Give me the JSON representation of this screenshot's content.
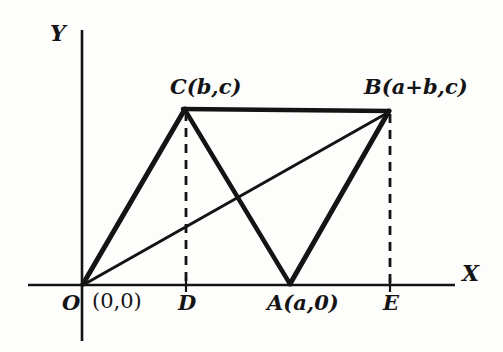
{
  "figure": {
    "kind": "coordinate-geometry-diagram",
    "background_color": "#fdfdfc",
    "ink_color": "#141414"
  },
  "axes": {
    "x_label": "X",
    "y_label": "Y",
    "x_axis": {
      "x1": 28,
      "y1": 285,
      "x2": 455,
      "y2": 285,
      "width": 2.6
    },
    "y_axis": {
      "x1": 82,
      "y1": 30,
      "x2": 82,
      "y2": 341,
      "width": 2.6
    }
  },
  "points": [
    {
      "id": "O",
      "label": "O",
      "x": 82,
      "y": 285
    },
    {
      "id": "D",
      "label": "D",
      "x": 186,
      "y": 285
    },
    {
      "id": "A",
      "label": "A(a,0)",
      "x": 290,
      "y": 285
    },
    {
      "id": "E",
      "label": "E",
      "x": 390,
      "y": 285
    },
    {
      "id": "C",
      "label": "C(b,c)",
      "x": 185,
      "y": 108
    },
    {
      "id": "B",
      "label": "B(a+b,c)",
      "x": 388,
      "y": 110
    }
  ],
  "labels": {
    "origin": "O",
    "origin_coord": "(0,0)",
    "point_d": "D",
    "point_a": "A(a,0)",
    "point_e": "E",
    "vertex_c": "C(b,c)",
    "vertex_b": "B(a+b,c)",
    "axis_x": "X",
    "axis_y": "Y"
  },
  "segments": [
    {
      "name": "side-OC",
      "from": "O",
      "to": "C",
      "style": "solid",
      "width": 5.0,
      "x1": 83,
      "y1": 284,
      "x2": 185,
      "y2": 109
    },
    {
      "name": "side-CB",
      "from": "C",
      "to": "B",
      "style": "solid",
      "width": 4.6,
      "x1": 183,
      "y1": 109,
      "x2": 389,
      "y2": 111
    },
    {
      "name": "side-CA",
      "from": "C",
      "to": "A",
      "style": "solid",
      "width": 4.4,
      "x1": 185,
      "y1": 110,
      "x2": 290,
      "y2": 284
    },
    {
      "name": "side-AB",
      "from": "A",
      "to": "B",
      "style": "solid",
      "width": 5.0,
      "x1": 290,
      "y1": 284,
      "x2": 389,
      "y2": 111
    },
    {
      "name": "diagonal-OB",
      "from": "O",
      "to": "B",
      "style": "solid",
      "width": 3.0,
      "x1": 83,
      "y1": 285,
      "x2": 389,
      "y2": 112
    }
  ],
  "dashed_segments": [
    {
      "name": "altitude-CD",
      "from": "C",
      "to": "D",
      "x1": 186,
      "y1": 112,
      "x2": 186,
      "y2": 284,
      "width": 2.8,
      "dash": "9,7"
    },
    {
      "name": "altitude-BE",
      "from": "B",
      "to": "E",
      "x1": 390,
      "y1": 114,
      "x2": 390,
      "y2": 284,
      "width": 2.8,
      "dash": "9,7"
    }
  ],
  "intersection": {
    "name": "diagonal-crossing",
    "x": 240,
    "y": 200
  }
}
